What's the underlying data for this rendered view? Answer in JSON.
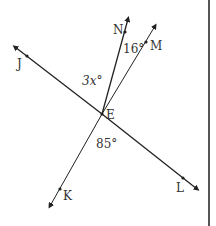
{
  "diagram": {
    "type": "geometry-lines-angles",
    "intersection_point": "E",
    "lines": [
      {
        "name": "line-JL",
        "through": [
          "J",
          "E",
          "L"
        ]
      },
      {
        "name": "line-MK",
        "through": [
          "M",
          "E",
          "K"
        ]
      },
      {
        "name": "ray-EN",
        "through": [
          "E",
          "N"
        ]
      }
    ],
    "points": {
      "J": "J",
      "L": "L",
      "M": "M",
      "K": "K",
      "N": "N",
      "E": "E"
    },
    "angle_labels": {
      "angle_NEM": "16°",
      "angle_JEN": "3x°",
      "angle_KEL": "85°"
    },
    "colors": {
      "line": "#222222",
      "label": "#333333",
      "border": "#555555"
    }
  }
}
